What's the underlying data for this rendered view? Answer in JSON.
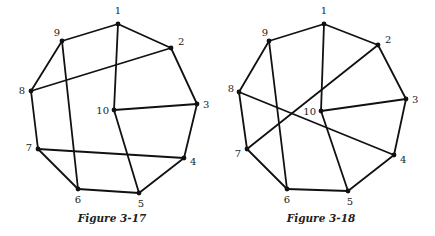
{
  "figures": [
    {
      "id": "fig-3-17",
      "caption": "Figure 3-17",
      "caption_pos": [
        112,
        222
      ],
      "vertices": [
        {
          "label": "1",
          "x": 118,
          "y": 24,
          "lx": 118,
          "ly": 14,
          "anchor": "middle"
        },
        {
          "label": "2",
          "x": 171,
          "y": 48,
          "lx": 178,
          "ly": 45,
          "anchor": "start"
        },
        {
          "label": "3",
          "x": 197,
          "y": 104,
          "lx": 203,
          "ly": 108,
          "anchor": "start"
        },
        {
          "label": "4",
          "x": 184,
          "y": 158,
          "lx": 190,
          "ly": 165,
          "anchor": "start"
        },
        {
          "label": "5",
          "x": 139,
          "y": 193,
          "lx": 141,
          "ly": 207,
          "anchor": "middle"
        },
        {
          "label": "6",
          "x": 78,
          "y": 189,
          "lx": 78,
          "ly": 203,
          "anchor": "middle"
        },
        {
          "label": "7",
          "x": 38,
          "y": 149,
          "lx": 32,
          "ly": 151,
          "anchor": "end"
        },
        {
          "label": "8",
          "x": 31,
          "y": 91,
          "lx": 25,
          "ly": 94,
          "anchor": "end"
        },
        {
          "label": "9",
          "x": 62,
          "y": 41,
          "lx": 57,
          "ly": 36,
          "anchor": "middle"
        },
        {
          "label": "10",
          "x": 114,
          "y": 110,
          "lx": 109,
          "ly": 114,
          "anchor": "end"
        }
      ],
      "edges": [
        [
          1,
          2
        ],
        [
          2,
          3
        ],
        [
          3,
          4
        ],
        [
          4,
          5
        ],
        [
          5,
          6
        ],
        [
          6,
          7
        ],
        [
          7,
          8
        ],
        [
          8,
          9
        ],
        [
          9,
          1
        ],
        [
          1,
          10
        ],
        [
          10,
          3
        ],
        [
          10,
          5
        ],
        [
          9,
          6
        ],
        [
          8,
          2
        ],
        [
          7,
          4
        ]
      ]
    },
    {
      "id": "fig-3-18",
      "caption": "Figure 3-18",
      "caption_pos": [
        321,
        222
      ],
      "vertices": [
        {
          "label": "1",
          "x": 324,
          "y": 24,
          "lx": 324,
          "ly": 14,
          "anchor": "middle"
        },
        {
          "label": "2",
          "x": 378,
          "y": 45,
          "lx": 385,
          "ly": 43,
          "anchor": "start"
        },
        {
          "label": "3",
          "x": 406,
          "y": 99,
          "lx": 412,
          "ly": 103,
          "anchor": "start"
        },
        {
          "label": "4",
          "x": 394,
          "y": 155,
          "lx": 400,
          "ly": 163,
          "anchor": "start"
        },
        {
          "label": "5",
          "x": 348,
          "y": 191,
          "lx": 350,
          "ly": 205,
          "anchor": "middle"
        },
        {
          "label": "6",
          "x": 287,
          "y": 189,
          "lx": 287,
          "ly": 203,
          "anchor": "middle"
        },
        {
          "label": "7",
          "x": 247,
          "y": 149,
          "lx": 241,
          "ly": 157,
          "anchor": "end"
        },
        {
          "label": "8",
          "x": 239,
          "y": 92,
          "lx": 234,
          "ly": 92,
          "anchor": "end"
        },
        {
          "label": "9",
          "x": 269,
          "y": 41,
          "lx": 265,
          "ly": 36,
          "anchor": "middle"
        },
        {
          "label": "10",
          "x": 321,
          "y": 111,
          "lx": 316,
          "ly": 115,
          "anchor": "end"
        }
      ],
      "edges": [
        [
          1,
          2
        ],
        [
          2,
          3
        ],
        [
          3,
          4
        ],
        [
          4,
          5
        ],
        [
          5,
          6
        ],
        [
          6,
          7
        ],
        [
          7,
          8
        ],
        [
          8,
          9
        ],
        [
          9,
          1
        ],
        [
          1,
          10
        ],
        [
          10,
          3
        ],
        [
          10,
          5
        ],
        [
          9,
          6
        ],
        [
          2,
          7
        ],
        [
          8,
          4
        ]
      ]
    }
  ],
  "style": {
    "line_color": "#111111",
    "label_color": "#222222",
    "background": "#ffffff"
  }
}
